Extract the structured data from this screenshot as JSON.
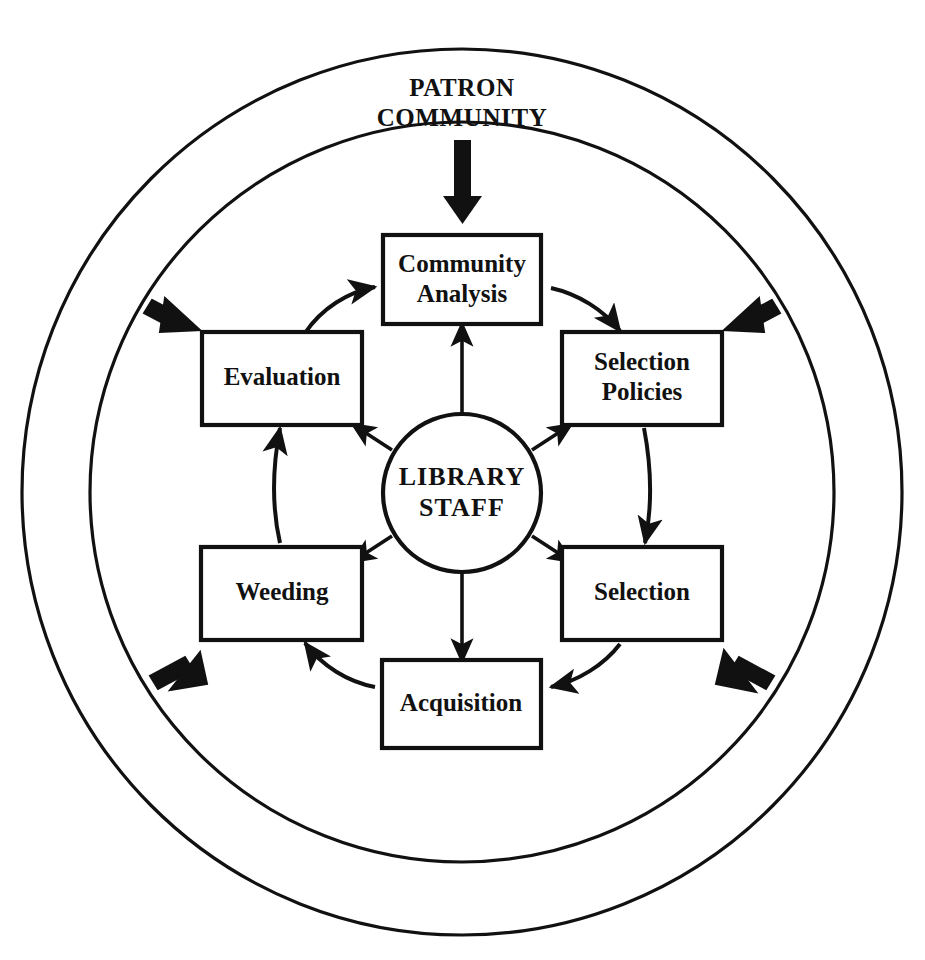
{
  "diagram": {
    "colors": {
      "stroke": "#111111",
      "background": "#ffffff",
      "text": "#111111"
    },
    "external_input": {
      "name": "patron-community",
      "line1": "PATRON",
      "line2": "COMMUNITY",
      "arrow_direction": "down",
      "arrow_style": "bold-solid",
      "target": "Community Analysis"
    },
    "center": {
      "name": "library-staff",
      "line1": "LIBRARY",
      "line2": "STAFF",
      "shape": "circle"
    },
    "rings": [
      {
        "name": "outer-ring",
        "label": ""
      },
      {
        "name": "middle-ring",
        "label": ""
      }
    ],
    "nodes": [
      {
        "id": "community-analysis",
        "line1": "Community",
        "line2": "Analysis",
        "position": "top"
      },
      {
        "id": "selection-policies",
        "line1": "Selection",
        "line2": "Policies",
        "position": "upper-right"
      },
      {
        "id": "selection",
        "line1": "Selection",
        "line2": "",
        "position": "lower-right"
      },
      {
        "id": "acquisition",
        "line1": "Acquisition",
        "line2": "",
        "position": "bottom"
      },
      {
        "id": "weeding",
        "line1": "Weeding",
        "line2": "",
        "position": "lower-left"
      },
      {
        "id": "evaluation",
        "line1": "Evaluation",
        "line2": "",
        "position": "upper-left"
      }
    ],
    "cycle_flow": [
      {
        "from": "community-analysis",
        "to": "selection-policies"
      },
      {
        "from": "selection-policies",
        "to": "selection"
      },
      {
        "from": "selection",
        "to": "acquisition"
      },
      {
        "from": "acquisition",
        "to": "weeding"
      },
      {
        "from": "weeding",
        "to": "evaluation"
      },
      {
        "from": "evaluation",
        "to": "community-analysis"
      }
    ],
    "staff_links": [
      {
        "node": "community-analysis",
        "direction": "outward",
        "style": "double-headed-vertical"
      },
      {
        "node": "selection-policies",
        "direction": "outward",
        "style": "diagonal"
      },
      {
        "node": "selection",
        "direction": "outward",
        "style": "diagonal"
      },
      {
        "node": "acquisition",
        "direction": "outward",
        "style": "vertical"
      },
      {
        "node": "weeding",
        "direction": "outward",
        "style": "diagonal"
      },
      {
        "node": "evaluation",
        "direction": "outward",
        "style": "diagonal"
      }
    ],
    "boundary_markers": [
      {
        "name": "boundary-arrow-upper-left",
        "position": "upper-left",
        "direction": "inward"
      },
      {
        "name": "boundary-arrow-upper-right",
        "position": "upper-right",
        "direction": "inward"
      },
      {
        "name": "boundary-arrow-lower-left",
        "position": "lower-left",
        "direction": "inward"
      },
      {
        "name": "boundary-arrow-lower-right",
        "position": "lower-right",
        "direction": "inward"
      }
    ]
  }
}
